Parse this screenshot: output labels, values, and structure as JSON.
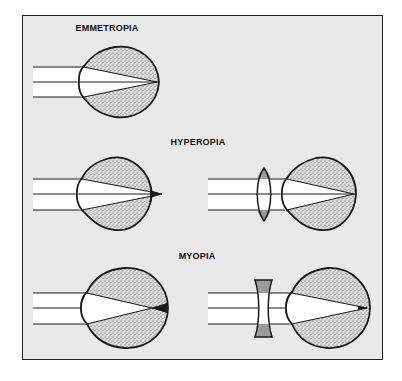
{
  "figure": {
    "panels": [
      {
        "id": "emmetropia",
        "label": "EMMETROPIA",
        "views": [
          "uncorrected eye focusing on retina"
        ]
      },
      {
        "id": "hyperopia",
        "label": "HYPEROPIA",
        "views": [
          "uncorrected eye focusing behind retina",
          "corrected with convex lens"
        ]
      },
      {
        "id": "myopia",
        "label": "MYOPIA",
        "views": [
          "uncorrected eye focusing in front of retina",
          "corrected with concave lens"
        ]
      }
    ]
  },
  "colors": {
    "frame_background": "#e9e9e9",
    "outline": "#1a1a1a",
    "stipple_fill": "#cfcfcf",
    "beam_fill": "#ffffff",
    "lens_fill": "#9a9a9a"
  },
  "icons": {
    "eye": "eye-icon",
    "convex_lens": "convex-lens-icon",
    "concave_lens": "concave-lens-icon"
  }
}
